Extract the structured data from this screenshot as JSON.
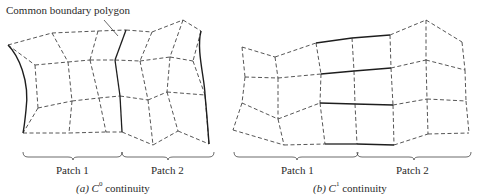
{
  "annotation": {
    "text": "Common boundary polygon"
  },
  "panels": [
    {
      "id": "a",
      "caption_prefix": "(a)",
      "caption_symbol": "C",
      "caption_superscript": "0",
      "caption_suffix": "continuity",
      "patch_labels": [
        "Patch 1",
        "Patch 2"
      ],
      "grid": [
        [
          [
            8,
            45
          ],
          [
            52,
            33
          ],
          [
            98,
            31
          ],
          [
            126,
            30
          ],
          [
            152,
            32
          ],
          [
            183,
            20
          ],
          [
            201,
            31
          ]
        ],
        [
          [
            35,
            65
          ],
          [
            68,
            62
          ],
          [
            90,
            60
          ],
          [
            115,
            60
          ],
          [
            140,
            61
          ],
          [
            170,
            57
          ],
          [
            193,
            61
          ]
        ],
        [
          [
            38,
            108
          ],
          [
            72,
            101
          ],
          [
            99,
            98
          ],
          [
            120,
            96
          ],
          [
            148,
            100
          ],
          [
            167,
            92
          ],
          [
            205,
            95
          ]
        ],
        [
          [
            23,
            133
          ],
          [
            69,
            133
          ],
          [
            106,
            132
          ],
          [
            122,
            132
          ],
          [
            153,
            145
          ],
          [
            178,
            131
          ],
          [
            209,
            144
          ]
        ]
      ],
      "solid_columns": [
        3
      ],
      "solid_row_segments": []
    },
    {
      "id": "b",
      "caption_prefix": "(b)",
      "caption_symbol": "C",
      "caption_superscript": "1",
      "caption_suffix": "continuity",
      "patch_labels": [
        "Patch 1",
        "Patch 2"
      ],
      "grid": [
        [
          [
            242,
            47
          ],
          [
            275,
            57
          ],
          [
            316,
            43
          ],
          [
            352,
            38
          ],
          [
            390,
            35
          ],
          [
            426,
            20
          ],
          [
            462,
            42
          ]
        ],
        [
          [
            245,
            77
          ],
          [
            278,
            78
          ],
          [
            321,
            74
          ],
          [
            354,
            71
          ],
          [
            391,
            68
          ],
          [
            426,
            60
          ],
          [
            465,
            70
          ]
        ],
        [
          [
            242,
            103
          ],
          [
            278,
            119
          ],
          [
            320,
            103
          ],
          [
            355,
            104
          ],
          [
            393,
            105
          ],
          [
            427,
            99
          ],
          [
            466,
            101
          ]
        ],
        [
          [
            233,
            130
          ],
          [
            284,
            145
          ],
          [
            325,
            144
          ],
          [
            357,
            144
          ],
          [
            394,
            145
          ],
          [
            428,
            134
          ],
          [
            469,
            133
          ]
        ]
      ],
      "solid_columns": [],
      "solid_row_segments": [
        [
          2,
          4
        ]
      ]
    }
  ],
  "colors": {
    "line": "#2b2b2b",
    "background": "#ffffff"
  }
}
